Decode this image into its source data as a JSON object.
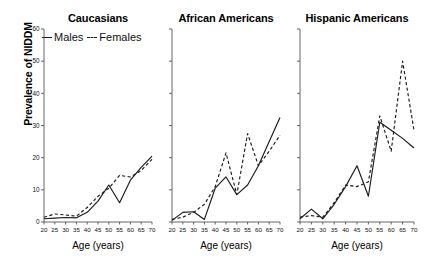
{
  "figure": {
    "ylabel": "Prevalence of NIDDM",
    "xlabel_1": "Age (years)",
    "xlabel_2": "Age (years)",
    "xlabel_3": "Age (years)",
    "legend": {
      "males_label": "Males",
      "females_label": "Females",
      "males_style": "solid",
      "females_style": "dashed",
      "line_color": "#1a1a1a"
    }
  },
  "chart_data": [
    {
      "type": "line",
      "title": "Caucasians",
      "xlabel": "Age (years)",
      "ylabel": "Prevalence of NIDDM",
      "x": [
        20,
        25,
        30,
        35,
        40,
        45,
        50,
        55,
        60,
        65,
        70
      ],
      "xlim": [
        20,
        70
      ],
      "ylim": [
        0,
        60
      ],
      "yticks": [
        0,
        10,
        20,
        30,
        40,
        50,
        60
      ],
      "xticks": [
        20,
        25,
        30,
        35,
        40,
        45,
        50,
        55,
        60,
        65,
        70
      ],
      "grid": false,
      "legend_position": "top-left",
      "series": [
        {
          "name": "Males",
          "style": "solid",
          "values": [
            1.0,
            1.2,
            1.4,
            1.3,
            3.0,
            6.5,
            11.5,
            6.0,
            13.0,
            17.0,
            20.5
          ]
        },
        {
          "name": "Females",
          "style": "dashed",
          "values": [
            1.5,
            2.5,
            2.2,
            1.8,
            4.5,
            8.0,
            10.5,
            14.5,
            14.0,
            16.0,
            19.5
          ]
        }
      ]
    },
    {
      "type": "line",
      "title": "African Americans",
      "xlabel": "Age (years)",
      "ylabel": "Prevalence of NIDDM",
      "x": [
        20,
        25,
        30,
        35,
        40,
        45,
        50,
        55,
        60,
        65,
        70
      ],
      "xlim": [
        20,
        70
      ],
      "ylim": [
        0,
        60
      ],
      "yticks": [
        0,
        10,
        20,
        30,
        40,
        50,
        60
      ],
      "xticks": [
        20,
        25,
        30,
        35,
        40,
        45,
        50,
        55,
        60,
        65,
        70
      ],
      "grid": false,
      "legend_position": "none",
      "series": [
        {
          "name": "Males",
          "style": "solid",
          "values": [
            0.5,
            3.0,
            3.2,
            0.8,
            10.5,
            14.0,
            8.5,
            11.5,
            17.5,
            25.0,
            32.5
          ]
        },
        {
          "name": "Females",
          "style": "dashed",
          "values": [
            0.8,
            1.5,
            3.0,
            5.5,
            11.0,
            21.5,
            8.5,
            27.5,
            17.5,
            22.0,
            27.0
          ]
        }
      ]
    },
    {
      "type": "line",
      "title": "Hispanic Americans",
      "xlabel": "Age (years)",
      "ylabel": "Prevalence of NIDDM",
      "x": [
        20,
        25,
        30,
        35,
        40,
        45,
        50,
        55,
        60,
        65,
        70
      ],
      "xlim": [
        20,
        70
      ],
      "ylim": [
        0,
        60
      ],
      "yticks": [
        0,
        10,
        20,
        30,
        40,
        50,
        60
      ],
      "xticks": [
        20,
        25,
        30,
        35,
        40,
        45,
        50,
        55,
        60,
        65,
        70
      ],
      "grid": false,
      "legend_position": "none",
      "series": [
        {
          "name": "Males",
          "style": "solid",
          "values": [
            1.0,
            4.0,
            1.0,
            5.5,
            11.0,
            17.5,
            8.0,
            31.0,
            28.5,
            26.0,
            23.0
          ]
        },
        {
          "name": "Females",
          "style": "dashed",
          "values": [
            1.5,
            2.0,
            1.5,
            6.0,
            11.5,
            11.0,
            12.5,
            33.0,
            22.0,
            50.0,
            28.5
          ]
        }
      ]
    }
  ]
}
